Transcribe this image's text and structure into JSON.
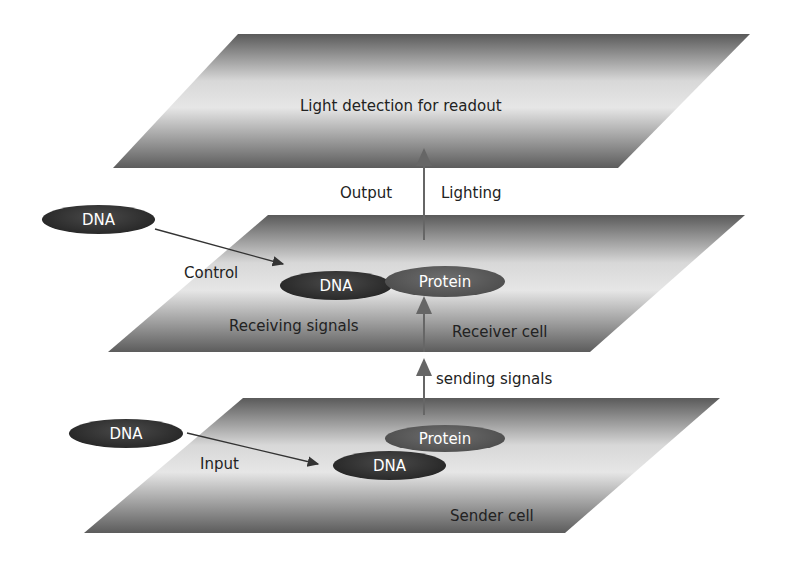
{
  "diagram": {
    "layers": [
      {
        "id": "readout",
        "label": "Light detection for readout"
      },
      {
        "id": "receiver",
        "label": "Receiver cell",
        "sub_label": "Receiving signals"
      },
      {
        "id": "sender",
        "label": "Sender cell"
      }
    ],
    "arrows": {
      "output_label": "Output",
      "lighting_label": "Lighting",
      "sending_label": "sending signals",
      "control_label": "Control",
      "input_label": "Input"
    },
    "nodes": {
      "control_dna": "DNA",
      "receiver_dna": "DNA",
      "receiver_protein": "Protein",
      "input_dna": "DNA",
      "sender_dna": "DNA",
      "sender_protein": "Protein"
    }
  }
}
